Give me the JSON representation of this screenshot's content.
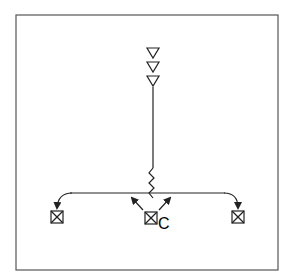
{
  "diagram": {
    "type": "lighting-plan-symbol",
    "frame": {
      "stroke": "#555555"
    },
    "source_symbol": {
      "name": "stacked-triangles",
      "count": 3
    },
    "wire": {
      "style": "straight-then-zigzag"
    },
    "branches": [
      {
        "id": "left",
        "arrow": "down"
      },
      {
        "id": "center",
        "arrows": [
          "up-left",
          "up-right"
        ],
        "label": "C"
      },
      {
        "id": "right",
        "arrow": "down"
      }
    ],
    "fixtures": [
      {
        "id": "left-fixture",
        "symbol": "boxed-x"
      },
      {
        "id": "center-fixture",
        "symbol": "boxed-x",
        "label": "C"
      },
      {
        "id": "right-fixture",
        "symbol": "boxed-x"
      }
    ],
    "colors": {
      "line": "#222222",
      "frame": "#555555",
      "background": "#ffffff"
    }
  }
}
